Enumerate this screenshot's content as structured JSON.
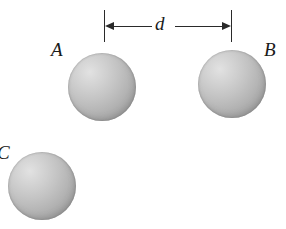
{
  "figure": {
    "background_color": "#ffffff",
    "width": 286,
    "height": 229,
    "ink_color": "#2a2a2a"
  },
  "bodies": [
    {
      "id": "A",
      "label": "A",
      "shape": "sphere",
      "fill": "shaded-gray-stipple",
      "highlight_color": "#e2e2e2",
      "shadow_color": "#9a9a9a"
    },
    {
      "id": "B",
      "label": "B",
      "shape": "sphere",
      "fill": "shaded-gray-stipple",
      "highlight_color": "#e2e2e2",
      "shadow_color": "#9a9a9a"
    },
    {
      "id": "C",
      "label": "C",
      "shape": "sphere",
      "fill": "shaded-gray-stipple",
      "highlight_color": "#e2e2e2",
      "shadow_color": "#9a9a9a"
    }
  ],
  "dimension": {
    "label": "d",
    "style": "double-headed-arrow-with-end-ticks",
    "from_body": "A",
    "to_body": "B"
  }
}
